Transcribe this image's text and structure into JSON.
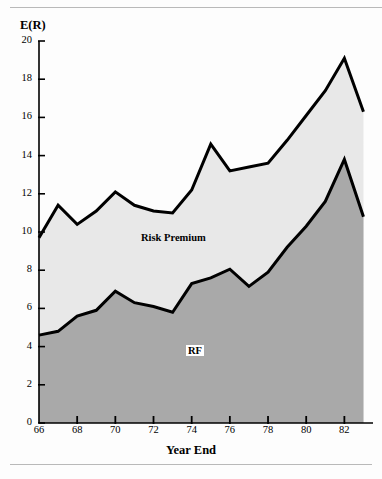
{
  "figure": {
    "y_axis_title": "E(R)",
    "x_axis_title": "Year End",
    "series_labels": {
      "upper": "Risk Premium",
      "lower": "RF"
    },
    "colors": {
      "line": "#000000",
      "risk_premium_fill": "#e8e8e8",
      "rf_fill": "#a9a9a9",
      "background": "#fdfdfd",
      "rule": "#b9b9b9"
    }
  },
  "chart_data": {
    "type": "area",
    "title": "",
    "subtitle": "",
    "xlabel": "Year End",
    "ylabel": "E(R)",
    "xlim": [
      66,
      83.5
    ],
    "ylim": [
      0,
      20
    ],
    "grid": false,
    "legend": "inline-labels",
    "stacked": true,
    "xticks": [
      66,
      68,
      70,
      72,
      74,
      76,
      78,
      80,
      82
    ],
    "xtick_labels": [
      "66",
      "68",
      "70",
      "72",
      "74",
      "76",
      "78",
      "80",
      "82"
    ],
    "yticks": [
      0,
      2,
      4,
      6,
      8,
      10,
      12,
      14,
      16,
      18,
      20
    ],
    "ytick_labels": [
      "0",
      "2",
      "4",
      "6",
      "8",
      "10",
      "12",
      "14",
      "16",
      "18",
      "20"
    ],
    "x": [
      66,
      67,
      68,
      69,
      70,
      71,
      72,
      73,
      74,
      75,
      76,
      77,
      78,
      79,
      80,
      81,
      82,
      83
    ],
    "series": [
      {
        "name": "RF",
        "note": "risk-free rate, lower boundary",
        "values": [
          4.6,
          4.8,
          5.6,
          5.9,
          6.9,
          6.3,
          6.1,
          5.8,
          7.3,
          7.6,
          8.05,
          7.15,
          7.9,
          9.2,
          10.3,
          11.6,
          13.8,
          10.8
        ]
      },
      {
        "name": "Risk Premium",
        "note": "premium above RF; upper boundary = RF + premium",
        "values": [
          5.1,
          6.6,
          4.8,
          5.2,
          5.2,
          5.1,
          5.0,
          5.2,
          4.9,
          7.0,
          5.15,
          6.25,
          5.7,
          5.6,
          5.8,
          5.8,
          5.3,
          5.5
        ]
      }
    ],
    "total_expected_return": [
      9.7,
      11.4,
      10.4,
      11.1,
      12.1,
      11.4,
      11.1,
      11.0,
      12.2,
      14.6,
      13.2,
      13.4,
      13.6,
      14.8,
      16.1,
      17.4,
      19.1,
      16.3
    ]
  }
}
